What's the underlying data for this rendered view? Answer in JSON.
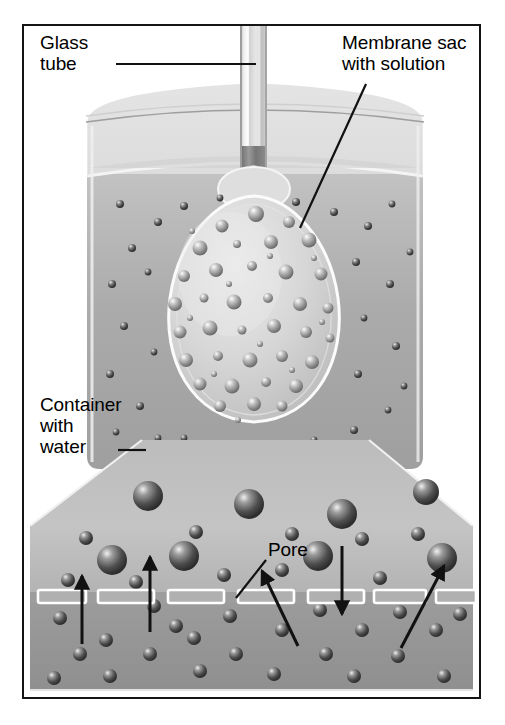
{
  "figure": {
    "background_color": "#ffffff",
    "frame_color": "#141414"
  },
  "labels": {
    "glass_tube": "Glass\ntube",
    "membrane_sac": "Membrane sac\nwith solution",
    "container_water": "Container\nwith\nwater",
    "pore": "Pore"
  },
  "colors": {
    "water_outer": "#a9a9a9",
    "water_outer_light": "#bdbdbd",
    "sac_fill": "#cfcfcf",
    "sac_highlight": "#e6e6e6",
    "glass": "#d8d8d8",
    "glass_highlight": "#f2f2f2",
    "tube_end_dark": "#6d6d6d",
    "inset_upper": "#b8b8b8",
    "inset_lower": "#9a9a9a",
    "membrane_band": "#8f8f8f",
    "pore_outline": "#ffffff",
    "molecule_dark": "#4a4a4a",
    "molecule_light": "#e8e8e8",
    "arrow": "#111111",
    "leader_line": "#111111"
  },
  "scene": {
    "beaker": {
      "label": "Container with water",
      "rim_y": 62,
      "body_top_y": 78,
      "body_bottom_y": 438,
      "left_x": 62,
      "right_x": 400,
      "water_surface_y": 140
    },
    "glass_tube": {
      "label": "Glass tube",
      "center_x": 229,
      "top_y": 0,
      "bottom_y": 158,
      "width": 26
    },
    "membrane_sac": {
      "label": "Membrane sac with solution",
      "center_x": 232,
      "neck_y": 152,
      "body_top_y": 176,
      "body_bottom_y": 400,
      "max_width": 180,
      "shape": "teardrop"
    },
    "magnifier_wedge": {
      "top_left_x": 118,
      "top_right_x": 345,
      "top_y": 412,
      "bottom_left_x": 6,
      "bottom_right_x": 449,
      "bottom_y": 500
    },
    "inset": {
      "top_y": 500,
      "bottom_y": 665,
      "membrane_y": 571,
      "membrane_thickness": 11,
      "upper_region_label": "solution side (outside membrane)",
      "lower_region_label": "water side (inside sac)"
    }
  },
  "pores": [
    {
      "x": 16,
      "width": 48
    },
    {
      "x": 76,
      "width": 56
    },
    {
      "x": 146,
      "width": 56
    },
    {
      "x": 216,
      "width": 56
    },
    {
      "x": 286,
      "width": 56
    },
    {
      "x": 348,
      "width": 52
    },
    {
      "x": 412,
      "width": 40
    }
  ],
  "arrows": [
    {
      "id": "arrow-1",
      "direction": "up",
      "x1": 58,
      "y1": 618,
      "x2": 58,
      "y2": 550
    },
    {
      "id": "arrow-2",
      "direction": "up",
      "x1": 126,
      "y1": 608,
      "x2": 126,
      "y2": 531
    },
    {
      "id": "arrow-3",
      "direction": "up-left",
      "x1": 274,
      "y1": 620,
      "x2": 238,
      "y2": 545
    },
    {
      "id": "arrow-4",
      "direction": "down",
      "x1": 318,
      "y1": 520,
      "x2": 318,
      "y2": 588
    },
    {
      "id": "arrow-5",
      "direction": "up-right",
      "x1": 377,
      "y1": 622,
      "x2": 420,
      "y2": 540
    }
  ],
  "molecules": {
    "sac_interior_count": 62,
    "outer_water_count": 34,
    "inset_large_count": 8,
    "inset_small_count": 33,
    "large_radius": 15,
    "small_radius": 7,
    "tiny_radius": 3
  },
  "leader_lines": {
    "glass_tube": {
      "x1": 92,
      "y1": 38,
      "x2": 232,
      "y2": 38
    },
    "membrane_sac": {
      "x1": 342,
      "y1": 58,
      "x2": 278,
      "y2": 200
    },
    "container_water": {
      "x1": 92,
      "y1": 424,
      "x2": 120,
      "y2": 424
    },
    "pore": {
      "x1": 242,
      "y1": 534,
      "x2": 212,
      "y2": 570
    }
  }
}
